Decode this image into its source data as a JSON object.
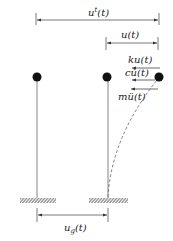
{
  "diagram": {
    "type": "sdof-structure-ground-motion",
    "labels": {
      "total_displacement": "uᵗ(t)",
      "total_displacement_base": "u",
      "total_displacement_sup": "t",
      "relative_displacement": "u(t)",
      "spring_force": "ku(t)",
      "damping_force": "cu̇(t)",
      "inertia_force": "mü(t)",
      "ground_displacement_base": "u",
      "ground_displacement_sub": "g",
      "ground_displacement_tail": "(t)"
    },
    "masses": [
      {
        "name": "original-position-mass",
        "x": 37,
        "y": 77
      },
      {
        "name": "ground-displaced-mass",
        "x": 107,
        "y": 77
      },
      {
        "name": "deformed-mass",
        "x": 159,
        "y": 77
      }
    ],
    "colors": {
      "line": "#555555",
      "mass": "#111111",
      "hatch": "#777777",
      "text": "#222222"
    }
  }
}
